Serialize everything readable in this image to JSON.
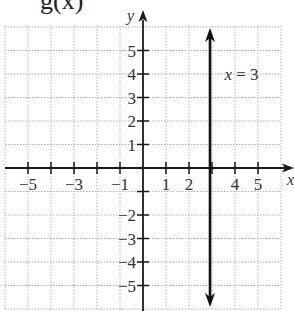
{
  "header": {
    "fragment": "g(x)"
  },
  "chart_data": {
    "type": "line",
    "title": "",
    "xlabel": "x",
    "ylabel": "y",
    "xlim": [
      -6,
      6
    ],
    "ylim": [
      -6,
      6
    ],
    "grid": true,
    "x_tick_labels": [
      "−5",
      "−3",
      "−1",
      "1",
      "2",
      "4",
      "5"
    ],
    "x_tick_values": [
      -5,
      -3,
      -1,
      1,
      2,
      4,
      5
    ],
    "x_ticks_all": [
      -5,
      -4,
      -3,
      -2,
      -1,
      1,
      2,
      3,
      4,
      5
    ],
    "y_tick_labels": [
      "5",
      "4",
      "3",
      "2",
      "1",
      "−2",
      "−3",
      "−4",
      "−5"
    ],
    "y_tick_values": [
      5,
      4,
      3,
      2,
      1,
      -2,
      -3,
      -4,
      -5
    ],
    "series": [
      {
        "name": "x = 3",
        "type": "vertical-line",
        "x": 3,
        "y_range": [
          -5.8,
          5.2
        ],
        "arrows": "both"
      }
    ],
    "annotations": [
      {
        "text": "x = 3",
        "x": 3.8,
        "y": 4
      }
    ]
  },
  "layout": {
    "origin_px": [
      143,
      168
    ],
    "unit_x_px": 23,
    "unit_y_px": 23.5,
    "colors": {
      "axis": "#1a1a1a",
      "grid": "#b5b5b5",
      "line": "#111111",
      "text": "#333333"
    }
  }
}
